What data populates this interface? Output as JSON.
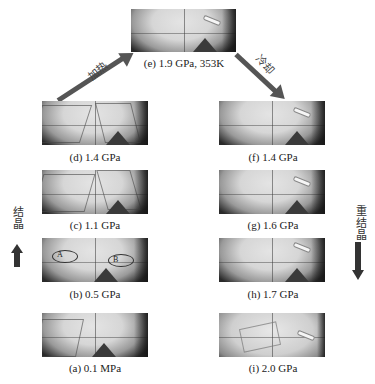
{
  "figure": {
    "panels": [
      {
        "id": "e",
        "label": "(e) 1.9 GPa, 353K",
        "position": "top-center"
      },
      {
        "id": "d",
        "label": "(d) 1.4 GPa",
        "position": "left-row1"
      },
      {
        "id": "c",
        "label": "(c) 1.1 GPa",
        "position": "left-row2"
      },
      {
        "id": "b",
        "label": "(b) 0.5 GPa",
        "position": "left-row3",
        "markers": [
          "A",
          "B"
        ]
      },
      {
        "id": "a",
        "label": "(a) 0.1 MPa",
        "position": "left-row4"
      },
      {
        "id": "f",
        "label": "(f) 1.4 GPa",
        "position": "right-row1"
      },
      {
        "id": "g",
        "label": "(g) 1.6 GPa",
        "position": "right-row2"
      },
      {
        "id": "h",
        "label": "(h) 1.7 GPa",
        "position": "right-row3"
      },
      {
        "id": "i",
        "label": "(i) 2.0 GPa",
        "position": "right-row4"
      }
    ],
    "arrows": {
      "heating": {
        "label": "加热",
        "direction": "up-right",
        "from": "d",
        "to": "e"
      },
      "cooling": {
        "label": "冷却",
        "direction": "down-right",
        "from": "e",
        "to": "f"
      },
      "crystallization": {
        "label": "结晶",
        "direction": "up",
        "side": "left"
      },
      "recrystallization": {
        "label": "重结晶",
        "direction": "down",
        "side": "right"
      }
    },
    "colors": {
      "arrow": "#555555",
      "text": "#222222",
      "background": "#ffffff"
    }
  }
}
